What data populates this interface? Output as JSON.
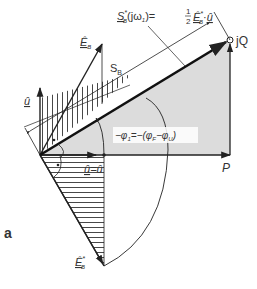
{
  "figure": {
    "panel_label": "a",
    "labels": {
      "apparent_power_formula": "S̲*ʙ(jω₁)=½Ê*ʙ·û̲",
      "apparent_power_lhs": "S",
      "apparent_power_lhs_sup": "*",
      "apparent_power_lhs_sub": "B",
      "apparent_power_arg": "(jω",
      "apparent_power_arg_sub": "1",
      "apparent_power_arg_close": ")=",
      "half_num": "1",
      "half_den": "2",
      "rhs_E": "Ê",
      "rhs_E_sup": "*",
      "rhs_E_sub": "B",
      "rhs_dot": "·",
      "rhs_u": "û",
      "S_B": "S",
      "S_B_sub": "B",
      "jQ": "jQ",
      "P": "P",
      "E_B": "Ê",
      "E_B_sub": "B",
      "u_vertical": "û",
      "u_eq_lhs": "û",
      "u_eq_rhs": "=û",
      "E_B_conj": "Ê",
      "E_B_conj_sup": "*",
      "E_B_conj_sub": "B",
      "phi_eq_lhs": "−φ",
      "phi_eq_lhs_sub": "1",
      "phi_eq_mid": "=−(φ",
      "phi_F_sub": "F",
      "phi_minus": "−φ",
      "phi_U_sub": "U",
      "phi_close": ")"
    },
    "colors": {
      "stroke": "#222222",
      "shade": "#d9d9d9",
      "hatch": "#333333"
    }
  }
}
